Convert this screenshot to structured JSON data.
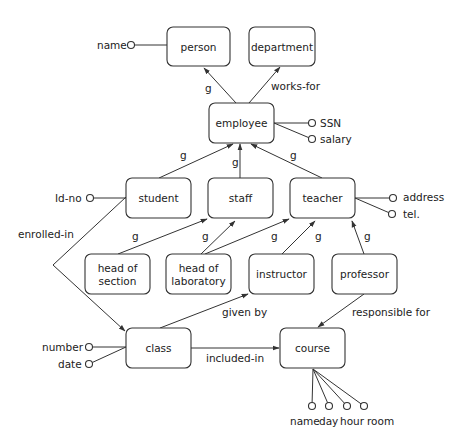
{
  "diagram": {
    "type": "entity-relationship / generalization diagram",
    "entities": [
      {
        "id": "person",
        "lines": [
          "person"
        ],
        "x": 167,
        "y": 27,
        "w": 63,
        "h": 39
      },
      {
        "id": "department",
        "lines": [
          "department"
        ],
        "x": 249,
        "y": 27,
        "w": 66,
        "h": 39
      },
      {
        "id": "employee",
        "lines": [
          "employee"
        ],
        "x": 209,
        "y": 103,
        "w": 65,
        "h": 40
      },
      {
        "id": "student",
        "lines": [
          "student"
        ],
        "x": 126,
        "y": 178,
        "w": 65,
        "h": 40
      },
      {
        "id": "staff",
        "lines": [
          "staff"
        ],
        "x": 208,
        "y": 178,
        "w": 65,
        "h": 40
      },
      {
        "id": "teacher",
        "lines": [
          "teacher"
        ],
        "x": 290,
        "y": 178,
        "w": 65,
        "h": 40
      },
      {
        "id": "head-of-section",
        "lines": [
          "head of",
          "section"
        ],
        "x": 85,
        "y": 254,
        "w": 65,
        "h": 40
      },
      {
        "id": "head-of-laboratory",
        "lines": [
          "head of",
          "laboratory"
        ],
        "x": 166,
        "y": 254,
        "w": 65,
        "h": 40
      },
      {
        "id": "instructor",
        "lines": [
          "instructor"
        ],
        "x": 249,
        "y": 254,
        "w": 65,
        "h": 40
      },
      {
        "id": "professor",
        "lines": [
          "professor"
        ],
        "x": 332,
        "y": 254,
        "w": 65,
        "h": 40
      },
      {
        "id": "class",
        "lines": [
          "class"
        ],
        "x": 126,
        "y": 328,
        "w": 65,
        "h": 40
      },
      {
        "id": "course",
        "lines": [
          "course"
        ],
        "x": 280,
        "y": 328,
        "w": 65,
        "h": 40
      }
    ],
    "attributes": [
      {
        "entity": "person",
        "label": "name",
        "cx": 131,
        "cy": 45,
        "from": [
          167,
          45
        ],
        "lx": 97,
        "ly": 49
      },
      {
        "entity": "employee",
        "label": "SSN",
        "cx": 312,
        "cy": 123,
        "from": [
          274,
          123
        ],
        "lx": 320,
        "ly": 127
      },
      {
        "entity": "employee",
        "label": "salary",
        "cx": 312,
        "cy": 139,
        "from": [
          274,
          123
        ],
        "lx": 320,
        "ly": 143
      },
      {
        "entity": "student",
        "label": "Id-no",
        "cx": 90,
        "cy": 198,
        "from": [
          126,
          198
        ],
        "lx": 55,
        "ly": 202
      },
      {
        "entity": "teacher",
        "label": "address",
        "cx": 393,
        "cy": 198,
        "from": [
          355,
          198
        ],
        "lx": 403,
        "ly": 201
      },
      {
        "entity": "teacher",
        "label": "tel.",
        "cx": 392,
        "cy": 214,
        "from": [
          355,
          198
        ],
        "lx": 403,
        "ly": 218
      },
      {
        "entity": "class",
        "label": "number",
        "cx": 89,
        "cy": 347,
        "from": [
          126,
          347
        ],
        "lx": 42,
        "ly": 351
      },
      {
        "entity": "class",
        "label": "date",
        "cx": 89,
        "cy": 364,
        "from": [
          126,
          347
        ],
        "lx": 58,
        "ly": 368
      },
      {
        "entity": "course",
        "label": "name",
        "cx": 312,
        "cy": 406,
        "from": [
          313,
          369
        ],
        "lx": 290,
        "ly": 425
      },
      {
        "entity": "course",
        "label": "day",
        "cx": 329,
        "cy": 406,
        "from": [
          313,
          369
        ],
        "lx": 319,
        "ly": 425
      },
      {
        "entity": "course",
        "label": "hour",
        "cx": 347,
        "cy": 406,
        "from": [
          313,
          369
        ],
        "lx": 340,
        "ly": 425
      },
      {
        "entity": "course",
        "label": "room",
        "cx": 364,
        "cy": 406,
        "from": [
          313,
          369
        ],
        "lx": 367,
        "ly": 425
      }
    ],
    "relationships": [
      {
        "label": "g",
        "from": [
          236,
          103
        ],
        "to": [
          204,
          68
        ],
        "lx": 205,
        "ly": 92
      },
      {
        "label": "works-for",
        "from": [
          249,
          103
        ],
        "to": [
          280,
          67
        ],
        "lx": 271,
        "ly": 90
      },
      {
        "label": "g",
        "from": [
          159,
          178
        ],
        "to": [
          233,
          144
        ],
        "lx": 180,
        "ly": 159
      },
      {
        "label": "g",
        "from": [
          240,
          178
        ],
        "to": [
          240,
          144
        ],
        "lx": 232,
        "ly": 166
      },
      {
        "label": "g",
        "from": [
          322,
          178
        ],
        "to": [
          251,
          144
        ],
        "lx": 290,
        "ly": 159
      },
      {
        "label": "g",
        "from": [
          118,
          254
        ],
        "to": [
          207,
          219
        ],
        "lx": 132,
        "ly": 240
      },
      {
        "label": "g",
        "from": [
          201,
          254
        ],
        "to": [
          235,
          221
        ],
        "lx": 202,
        "ly": 240
      },
      {
        "label": "g",
        "from": [
          205,
          254
        ],
        "to": [
          289,
          219
        ],
        "lx": 271,
        "ly": 240
      },
      {
        "label": "g",
        "from": [
          282,
          254
        ],
        "to": [
          315,
          221
        ],
        "lx": 315,
        "ly": 240
      },
      {
        "label": "g",
        "from": [
          364,
          254
        ],
        "to": [
          352,
          221
        ],
        "lx": 364,
        "ly": 240
      },
      {
        "label": "given by",
        "from": [
          160,
          328
        ],
        "to": [
          248,
          294
        ],
        "lx": 222,
        "ly": 316
      },
      {
        "label": "responsible for",
        "from": [
          364,
          294
        ],
        "to": [
          318,
          327
        ],
        "lx": 352,
        "ly": 316
      },
      {
        "label": "included-in",
        "from": [
          191,
          348
        ],
        "to": [
          279,
          348
        ],
        "lx": 206,
        "ly": 362
      }
    ],
    "enrolled_in": {
      "label": "enrolled-in",
      "points": [
        [
          126,
          197
        ],
        [
          53,
          265
        ],
        [
          125,
          331
        ]
      ],
      "lx": 18,
      "ly": 238
    }
  }
}
